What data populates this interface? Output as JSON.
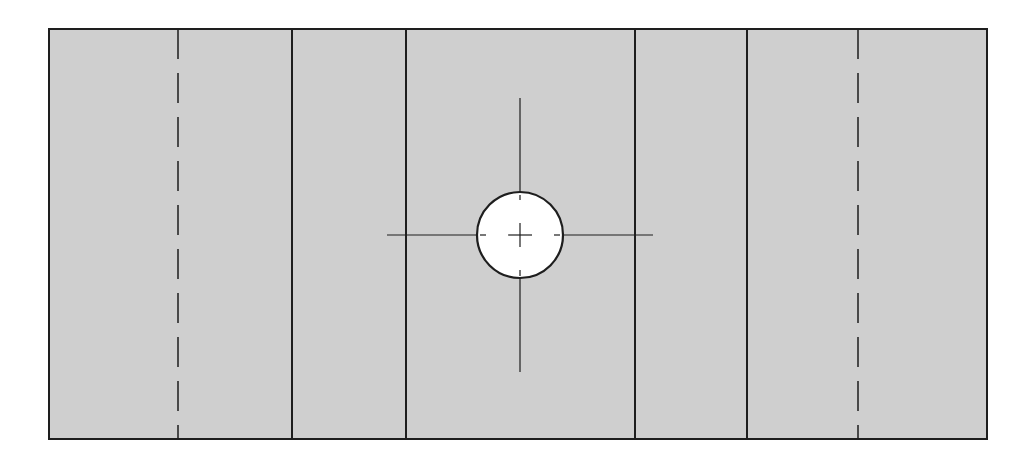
{
  "diagram": {
    "type": "technical-drawing",
    "colors": {
      "background": "#ffffff",
      "panel_fill": "#cfcfcf",
      "stroke": "#1e1e1e",
      "hole_fill": "#ffffff"
    },
    "outline": {
      "x": 49,
      "y": 29,
      "width": 938,
      "height": 410
    },
    "solid_lines_x": [
      292,
      406,
      635,
      747
    ],
    "dashed_lines_x": [
      178,
      858
    ],
    "hole": {
      "cx": 520,
      "cy": 235,
      "r": 43
    },
    "centerlines": {
      "horizontal": {
        "y": 235,
        "x1": 387,
        "x2": 653
      },
      "vertical": {
        "x": 520,
        "y1": 98,
        "y2": 372
      }
    }
  }
}
